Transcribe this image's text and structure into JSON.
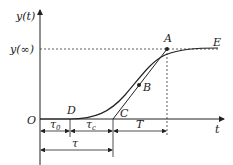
{
  "diagram": {
    "type": "step-response-tangent",
    "axes": {
      "y_label": "y(t)",
      "x_label": "t",
      "origin_label": "O",
      "steady_state_label": "y(∞)"
    },
    "points": {
      "A": "A",
      "B": "B",
      "C": "C",
      "D": "D",
      "E": "E"
    },
    "intervals": {
      "tau0": {
        "base": "τ",
        "sub": "0"
      },
      "tauc": {
        "base": "τ",
        "sub": "c"
      },
      "T": "T",
      "tau": "τ"
    },
    "colors": {
      "line": "#222222",
      "background": "#ffffff"
    }
  }
}
